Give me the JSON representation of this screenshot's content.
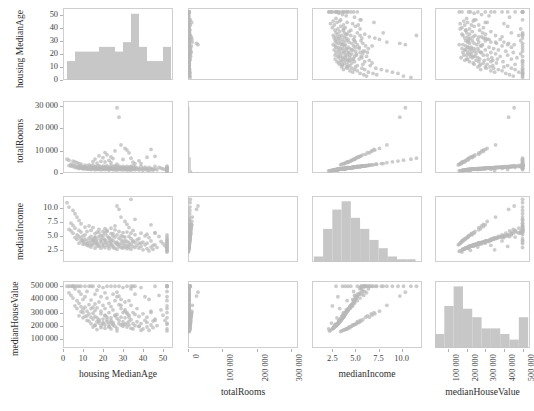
{
  "chart_data": {
    "type": "scatter",
    "title": "",
    "subtitle": "",
    "plot_kind": "scatter-plot-matrix",
    "grid": false,
    "legend": null,
    "marker_color": "#b9b9b9",
    "histogram_color": "#c4c4c4",
    "frame_color": "#cfcfcf",
    "n_points": 200,
    "variables": [
      {
        "key": "housingMedianAge",
        "label": "housing MedianAge",
        "axis_range": [
          0,
          55
        ],
        "ticks": [
          0,
          10,
          20,
          30,
          40,
          50
        ],
        "tick_labels": [
          "0",
          "10",
          "20",
          "30",
          "40",
          "50"
        ],
        "tick_label_rotation": 0
      },
      {
        "key": "totalRooms",
        "label": "totalRooms",
        "axis_range": [
          0,
          320000
        ],
        "ticks": [
          0,
          100000,
          200000,
          300000
        ],
        "tick_labels": [
          "0",
          "100 000",
          "200 000",
          "300 000"
        ],
        "tick_label_rotation": -90,
        "diag_ticks": [
          0,
          10000,
          20000,
          30000
        ],
        "diag_tick_labels": [
          "0",
          "10 000",
          "20 000",
          "30 000"
        ]
      },
      {
        "key": "medianIncome",
        "label": "medianIncome",
        "axis_range": [
          0.3,
          12.2
        ],
        "ticks": [
          2.5,
          5.0,
          7.5,
          10.0
        ],
        "tick_labels": [
          "2.5",
          "5.0",
          "7.5",
          "10.0"
        ],
        "tick_label_rotation": 0
      },
      {
        "key": "medianHouseValue",
        "label": "medianHouseValue",
        "axis_range": [
          30000,
          540000
        ],
        "ticks": [
          100000,
          200000,
          300000,
          400000,
          500000
        ],
        "tick_labels": [
          "100 000",
          "200 000",
          "300 000",
          "400 000",
          "500 000"
        ],
        "tick_label_rotation": -90
      }
    ],
    "row_axis_ticks": {
      "housingMedianAge": {
        "ticks": [
          0,
          10,
          20,
          30,
          40,
          50
        ],
        "tick_labels": [
          "0",
          "10",
          "20",
          "30",
          "40",
          "50"
        ],
        "range": [
          0,
          55
        ]
      },
      "totalRooms": {
        "ticks": [
          0,
          10000,
          20000,
          30000
        ],
        "tick_labels": [
          "0",
          "10 000",
          "20 000",
          "30 000"
        ],
        "range": [
          0,
          32000
        ]
      },
      "medianIncome": {
        "ticks": [
          2.5,
          5.0,
          7.5,
          10.0
        ],
        "tick_labels": [
          "2.5",
          "5.0",
          "7.5",
          "10.0"
        ],
        "range": [
          0.3,
          12.2
        ]
      },
      "medianHouseValue": {
        "ticks": [
          100000,
          200000,
          300000,
          400000,
          500000
        ],
        "tick_labels": [
          "100 000",
          "200 000",
          "300 000",
          "400 000",
          "500 000"
        ],
        "range": [
          30000,
          540000
        ]
      }
    },
    "diagonal_histograms": [
      {
        "variable": "housingMedianAge",
        "bin_edges": [
          2,
          6,
          10,
          14,
          18,
          22,
          26,
          30,
          34,
          38,
          42,
          46,
          50,
          54
        ],
        "counts": [
          4,
          6,
          6,
          6,
          7,
          7,
          6,
          8,
          14,
          7,
          4,
          4,
          7
        ]
      },
      {
        "variable": "totalRooms",
        "bin_edges": [
          0,
          4000,
          8000,
          12000,
          16000,
          20000,
          24000,
          28000,
          32000
        ],
        "counts": [
          152,
          36,
          6,
          2,
          0,
          0,
          2,
          2
        ]
      },
      {
        "variable": "medianIncome",
        "bin_edges": [
          0.5,
          1.5,
          2.5,
          3.5,
          4.5,
          5.5,
          6.5,
          7.5,
          8.5,
          9.5,
          10.5,
          11.5
        ],
        "counts": [
          4,
          24,
          38,
          44,
          32,
          24,
          16,
          10,
          4,
          2,
          2
        ]
      },
      {
        "variable": "medianHouseValue",
        "bin_edges": [
          30000,
          80000,
          130000,
          180000,
          230000,
          280000,
          330000,
          380000,
          430000,
          480000,
          530000
        ],
        "counts": [
          10,
          30,
          44,
          28,
          22,
          14,
          14,
          10,
          6,
          22
        ]
      }
    ],
    "series": [
      {
        "name": "block groups",
        "housingMedianAge": [
          52,
          52,
          52,
          52,
          52,
          52,
          52,
          52,
          52,
          52,
          52,
          52,
          52,
          52,
          52,
          52,
          52,
          51,
          50,
          49,
          48,
          47,
          46,
          46,
          45,
          45,
          44,
          44,
          43,
          43,
          42,
          42,
          41,
          41,
          40,
          40,
          39,
          39,
          38,
          38,
          37,
          37,
          36,
          36,
          36,
          35,
          35,
          35,
          34,
          34,
          34,
          34,
          33,
          33,
          33,
          33,
          32,
          32,
          32,
          32,
          31,
          31,
          31,
          31,
          30,
          30,
          30,
          30,
          29,
          29,
          29,
          29,
          28,
          28,
          28,
          28,
          27,
          27,
          27,
          27,
          26,
          26,
          26,
          26,
          25,
          25,
          25,
          25,
          24,
          24,
          24,
          24,
          23,
          23,
          23,
          23,
          22,
          22,
          22,
          22,
          21,
          21,
          21,
          21,
          20,
          20,
          20,
          20,
          19,
          19,
          19,
          19,
          18,
          18,
          18,
          18,
          17,
          17,
          17,
          17,
          16,
          16,
          16,
          16,
          16,
          15,
          15,
          15,
          15,
          14,
          14,
          14,
          14,
          14,
          13,
          13,
          13,
          13,
          12,
          12,
          12,
          12,
          11,
          11,
          11,
          11,
          10,
          10,
          10,
          10,
          9,
          9,
          9,
          9,
          8,
          8,
          8,
          8,
          7,
          7,
          7,
          6,
          6,
          6,
          5,
          5,
          5,
          4,
          4,
          3,
          3,
          2,
          36,
          34,
          33,
          32,
          31,
          29,
          28,
          27,
          26,
          25,
          24,
          23,
          22,
          21,
          20,
          19,
          18,
          17,
          16,
          15,
          42,
          39,
          38,
          35,
          30,
          27,
          24,
          21,
          44,
          46
        ],
        "totalRooms": [
          1467,
          2079,
          2491,
          1020,
          1505,
          1914,
          2210,
          1627,
          1158,
          881,
          1512,
          2022,
          3000,
          1310,
          1877,
          2447,
          960,
          1600,
          1820,
          2110,
          2520,
          1415,
          1730,
          2910,
          1290,
          1680,
          2100,
          1540,
          1100,
          2440,
          1900,
          1340,
          2600,
          1770,
          2040,
          1210,
          1580,
          2890,
          1940,
          1360,
          2230,
          1700,
          2700,
          1450,
          1990,
          2070,
          3110,
          1600,
          1800,
          2340,
          1250,
          2880,
          1980,
          1450,
          2570,
          1720,
          2100,
          1640,
          2980,
          1330,
          1860,
          2510,
          1540,
          2200,
          1700,
          2950,
          1360,
          2080,
          1930,
          2600,
          1480,
          2260,
          1760,
          3050,
          1600,
          2390,
          1290,
          2020,
          2740,
          1850,
          1420,
          2510,
          1960,
          3220,
          1640,
          2180,
          1500,
          2860,
          1720,
          2290,
          1880,
          3400,
          1580,
          2440,
          2080,
          1340,
          2610,
          1900,
          3180,
          1700,
          2230,
          1490,
          2890,
          1960,
          2420,
          1620,
          3050,
          1830,
          2150,
          1400,
          2700,
          2000,
          2590,
          1760,
          3270,
          1580,
          2260,
          1890,
          3020,
          1660,
          2480,
          2130,
          1440,
          2870,
          1920,
          3450,
          1750,
          2300,
          2040,
          1560,
          3190,
          1830,
          2610,
          2240,
          1680,
          3620,
          2000,
          2450,
          1900,
          3080,
          2150,
          1740,
          2790,
          2320,
          1880,
          3540,
          2080,
          2660,
          2210,
          1820,
          3890,
          2400,
          3020,
          2140,
          1960,
          4210,
          2550,
          3160,
          2280,
          4600,
          2720,
          3380,
          2460,
          4980,
          2900,
          3640,
          5320,
          3100,
          3880,
          5700,
          3300,
          6100,
          4200,
          6600,
          8900,
          10200,
          10900,
          12500,
          24800,
          29000,
          9800,
          6400,
          7200,
          5600,
          8100,
          4900,
          6800,
          5200,
          7600,
          4400,
          6200,
          5000,
          7000,
          4200,
          5400,
          4800,
          6000,
          3900,
          4600,
          9100,
          10500,
          7400,
          6900,
          5800,
          4700,
          4100,
          3600,
          8300,
          9600
        ],
        "medianIncome": [
          2.9,
          3.6,
          4.2,
          2.5,
          3.1,
          3.9,
          4.5,
          3.3,
          2.4,
          2.1,
          3.0,
          4.1,
          5.2,
          2.8,
          3.7,
          4.8,
          2.2,
          3.2,
          3.6,
          4.0,
          4.9,
          2.9,
          3.4,
          5.6,
          2.6,
          3.3,
          4.1,
          3.0,
          2.3,
          4.7,
          3.7,
          2.7,
          5.0,
          3.4,
          3.9,
          2.5,
          3.1,
          5.5,
          3.7,
          2.8,
          4.3,
          3.3,
          5.2,
          2.9,
          3.8,
          4.0,
          6.0,
          3.1,
          3.5,
          4.5,
          2.6,
          5.5,
          3.8,
          2.9,
          4.9,
          3.3,
          4.0,
          3.2,
          5.7,
          2.7,
          3.6,
          4.8,
          3.0,
          4.2,
          3.3,
          5.6,
          2.8,
          4.0,
          3.7,
          5.0,
          2.9,
          4.3,
          3.4,
          5.8,
          3.1,
          4.6,
          2.6,
          3.9,
          5.2,
          3.6,
          2.8,
          4.8,
          3.8,
          6.1,
          3.2,
          4.2,
          2.9,
          5.4,
          3.4,
          4.4,
          3.6,
          6.4,
          3.1,
          4.7,
          4.0,
          2.7,
          5.0,
          3.7,
          6.0,
          3.3,
          4.3,
          2.9,
          5.5,
          3.8,
          4.6,
          3.2,
          5.8,
          3.5,
          4.1,
          2.8,
          5.1,
          3.9,
          4.9,
          3.4,
          6.2,
          3.1,
          4.4,
          3.6,
          5.7,
          3.2,
          4.7,
          4.1,
          2.8,
          5.4,
          3.7,
          6.5,
          3.4,
          4.4,
          3.9,
          3.0,
          6.0,
          3.5,
          4.9,
          4.2,
          3.2,
          6.8,
          3.8,
          4.6,
          3.6,
          5.8,
          4.1,
          3.3,
          5.2,
          4.4,
          3.6,
          6.6,
          4.0,
          5.0,
          4.2,
          3.5,
          7.2,
          4.6,
          5.7,
          4.1,
          3.7,
          7.8,
          4.9,
          6.0,
          4.4,
          8.4,
          5.2,
          6.4,
          4.7,
          9.0,
          5.5,
          6.9,
          9.6,
          5.9,
          7.3,
          10.2,
          6.2,
          11.0,
          8.0,
          11.6,
          6.5,
          7.1,
          7.6,
          8.4,
          9.8,
          10.4,
          6.8,
          5.0,
          5.4,
          4.6,
          5.8,
          4.2,
          5.1,
          4.4,
          5.6,
          3.9,
          4.8,
          4.3,
          5.3,
          3.7,
          4.5,
          4.1,
          4.9,
          3.5,
          4.0,
          6.3,
          7.0,
          5.5,
          5.2,
          4.7,
          4.1,
          3.8,
          3.4,
          6.1,
          6.7
        ],
        "medianHouseValue": [
          500001,
          500001,
          500001,
          350000,
          420000,
          500001,
          500001,
          330000,
          220000,
          175000,
          260000,
          390000,
          500001,
          210000,
          300000,
          460000,
          160000,
          240000,
          280000,
          320000,
          430000,
          200000,
          250000,
          500001,
          185000,
          235000,
          310000,
          205000,
          165000,
          400000,
          265000,
          190000,
          420000,
          240000,
          290000,
          175000,
          215000,
          490000,
          270000,
          195000,
          330000,
          230000,
          440000,
          200000,
          285000,
          300000,
          500001,
          215000,
          245000,
          355000,
          180000,
          480000,
          280000,
          205000,
          390000,
          235000,
          300000,
          220000,
          500001,
          190000,
          260000,
          380000,
          210000,
          320000,
          230000,
          490000,
          195000,
          300000,
          265000,
          400000,
          205000,
          330000,
          240000,
          500001,
          215000,
          360000,
          180000,
          285000,
          420000,
          255000,
          195000,
          390000,
          275000,
          500001,
          225000,
          320000,
          205000,
          440000,
          240000,
          345000,
          260000,
          500001,
          215000,
          370000,
          300000,
          190000,
          410000,
          265000,
          500001,
          230000,
          330000,
          205000,
          450000,
          280000,
          355000,
          225000,
          490000,
          250000,
          310000,
          200000,
          420000,
          290000,
          380000,
          245000,
          500001,
          220000,
          335000,
          260000,
          470000,
          230000,
          365000,
          315000,
          200000,
          440000,
          270000,
          500001,
          250000,
          340000,
          295000,
          215000,
          500001,
          265000,
          395000,
          330000,
          235000,
          500001,
          290000,
          360000,
          275000,
          460000,
          310000,
          240000,
          420000,
          340000,
          270000,
          500001,
          300000,
          400000,
          325000,
          260000,
          500001,
          345000,
          440000,
          305000,
          275000,
          500001,
          370000,
          460000,
          330000,
          500001,
          390000,
          480000,
          350000,
          500001,
          410000,
          500001,
          500001,
          430000,
          500001,
          500001,
          450000,
          500001,
          500001,
          500001,
          265000,
          290000,
          310000,
          355000,
          425000,
          455000,
          280000,
          210000,
          225000,
          195000,
          245000,
          180000,
          215000,
          185000,
          235000,
          170000,
          205000,
          190000,
          225000,
          165000,
          195000,
          175000,
          210000,
          160000,
          175000,
          275000,
          300000,
          240000,
          230000,
          205000,
          180000,
          170000,
          155000,
          265000,
          290000
        ]
      }
    ]
  },
  "figure": {
    "background_color": "#ffffff",
    "axis_titles": {
      "bottom": [
        "housing MedianAge",
        "totalRooms",
        "medianIncome",
        "medianHouseValue"
      ],
      "left": [
        "housing MedianAge",
        "totalRooms",
        "medianIncome",
        "medianHouseValue"
      ]
    }
  }
}
